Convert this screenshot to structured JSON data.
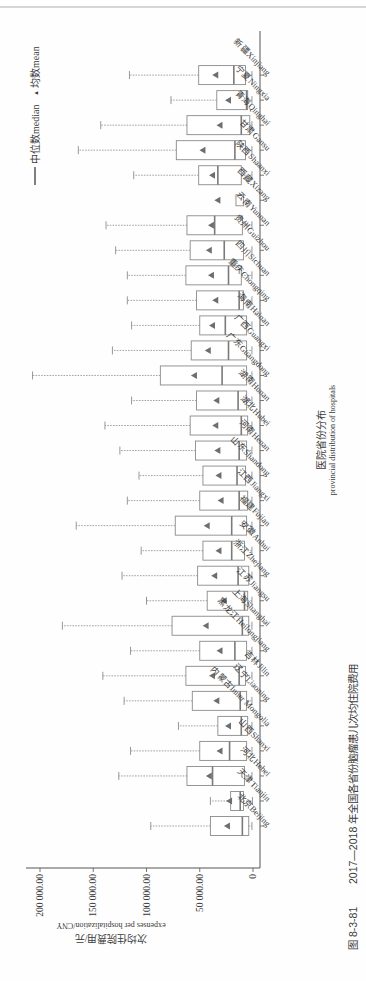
{
  "page": {
    "header_rule": true,
    "caption": {
      "figure_number": "图 8-3-81",
      "text": "2017—2018 年全国各省份脑瘤患儿次均住院费用"
    }
  },
  "legend": {
    "median_label": "中位数median",
    "mean_label": "均数mean",
    "mean_marker": "▲"
  },
  "colors": {
    "box_stroke": "#8a8a8a",
    "median_line": "#7a7a7a",
    "mean_marker": "#6e6e6e",
    "whisker": "#8c8c8c",
    "axis": "#555555",
    "text": "#3a3a3a"
  },
  "chart_data": {
    "type": "box",
    "orientation": "page rotated 90° (categories along vertical page axis)",
    "title": "2017—2018 年全国各省份脑瘤患儿次均住院费用",
    "xlabel": "医院省份分布 provincial distribution of hospitals",
    "xlabel_cn": "医院省份分布",
    "xlabel_en": "provincial distribution of hospitals",
    "ylabel": "次均住院费用/元 expenses per hospitalization/CNY",
    "ylabel_cn": "次均住院费用/元",
    "ylabel_en": "expenses per hospitalization/CNY",
    "ylim": [
      0,
      200000
    ],
    "yticks": [
      0,
      50000,
      100000,
      150000,
      200000
    ],
    "ytick_labels": [
      "0",
      "50 000.00",
      "100 000.00",
      "150 000.00",
      "200 000.00"
    ],
    "legend": [
      "中位数median",
      "均数mean"
    ],
    "grid": false,
    "categories": [
      "北京Beijing",
      "天津Tianjin",
      "河北Hebei",
      "山西Shanxi",
      "内蒙古Inner Mongolia",
      "辽宁Liaoning",
      "吉林Jilin",
      "黑龙江Heilongjiang",
      "上海Shanghai",
      "江苏Jiangsu",
      "浙江Zhejiang",
      "安徽Anhui",
      "福建Fujian",
      "江西Jiangxi",
      "山东Shandong",
      "河南Henan",
      "湖北Hubei",
      "湖南Hunan",
      "广东Guangdong",
      "广西Guangxi",
      "海南Hainan",
      "重庆Chongqing",
      "四川Sichuan",
      "贵州Guizhou",
      "云南Yunnan",
      "西藏Xizang",
      "陕西Shaanxi",
      "甘肃Gansu",
      "青海Qinghai",
      "宁夏Ningxia",
      "新疆Xinjiang"
    ],
    "boxes": [
      {
        "min": 1000,
        "q1": 4000,
        "median": 10000,
        "q3": 40000,
        "max": 96000,
        "mean": 24000
      },
      {
        "min": 500,
        "q1": 9000,
        "median": 12000,
        "q3": 21000,
        "max": 40000,
        "mean": 22000
      },
      {
        "min": 1000,
        "q1": 8000,
        "median": 38000,
        "q3": 62000,
        "max": 126000,
        "mean": 41000
      },
      {
        "min": 1000,
        "q1": 6000,
        "median": 22000,
        "q3": 50000,
        "max": 115000,
        "mean": 31000
      },
      {
        "min": 1000,
        "q1": 5000,
        "median": 11000,
        "q3": 33000,
        "max": 70000,
        "mean": 23000
      },
      {
        "min": 1000,
        "q1": 6000,
        "median": 12000,
        "q3": 57000,
        "max": 121000,
        "mean": 34000
      },
      {
        "min": 1000,
        "q1": 7000,
        "median": 13000,
        "q3": 63000,
        "max": 141000,
        "mean": 38000
      },
      {
        "min": 1000,
        "q1": 6000,
        "median": 17000,
        "q3": 50000,
        "max": 115000,
        "mean": 31000
      },
      {
        "min": 1000,
        "q1": 4000,
        "median": 10000,
        "q3": 76000,
        "max": 179000,
        "mean": 44000
      },
      {
        "min": 1000,
        "q1": 5000,
        "median": 8000,
        "q3": 43000,
        "max": 100000,
        "mean": 27000
      },
      {
        "min": 1000,
        "q1": 4000,
        "median": 14000,
        "q3": 52000,
        "max": 123000,
        "mean": 36000
      },
      {
        "min": 1000,
        "q1": 8000,
        "median": 20000,
        "q3": 47000,
        "max": 105000,
        "mean": 32000
      },
      {
        "min": 1000,
        "q1": 6000,
        "median": 20000,
        "q3": 73000,
        "max": 166000,
        "mean": 43000
      },
      {
        "min": 1000,
        "q1": 5000,
        "median": 13000,
        "q3": 50000,
        "max": 118000,
        "mean": 30000
      },
      {
        "min": 1000,
        "q1": 7000,
        "median": 15000,
        "q3": 47000,
        "max": 107000,
        "mean": 32000
      },
      {
        "min": 1000,
        "q1": 6000,
        "median": 13000,
        "q3": 54000,
        "max": 125000,
        "mean": 33000
      },
      {
        "min": 1000,
        "q1": 5000,
        "median": 11000,
        "q3": 59000,
        "max": 139000,
        "mean": 35000
      },
      {
        "min": 1000,
        "q1": 6000,
        "median": 14000,
        "q3": 53000,
        "max": 114000,
        "mean": 34000
      },
      {
        "min": 1000,
        "q1": 6000,
        "median": 29000,
        "q3": 87000,
        "max": 207000,
        "mean": 55000
      },
      {
        "min": 1000,
        "q1": 6000,
        "median": 23000,
        "q3": 58000,
        "max": 132000,
        "mean": 42000
      },
      {
        "min": 1000,
        "q1": 6000,
        "median": 26000,
        "q3": 50000,
        "max": 114000,
        "mean": 38000
      },
      {
        "min": 1000,
        "q1": 9000,
        "median": 13000,
        "q3": 53000,
        "max": 118000,
        "mean": 35000
      },
      {
        "min": 1000,
        "q1": 11000,
        "median": 23000,
        "q3": 63000,
        "max": 118000,
        "mean": 39000
      },
      {
        "min": 1000,
        "q1": 9000,
        "median": 27000,
        "q3": 59000,
        "max": 129000,
        "mean": 41000
      },
      {
        "min": 1000,
        "q1": 10000,
        "median": 36000,
        "q3": 62000,
        "max": 138000,
        "mean": 39000
      },
      {
        "min": 9000,
        "q1": 9000,
        "median": 12000,
        "q3": 16000,
        "max": 16000,
        "mean": 33000,
        "no_whiskers": true
      },
      {
        "min": 1000,
        "q1": 11000,
        "median": 33000,
        "q3": 51000,
        "max": 112000,
        "mean": 38000
      },
      {
        "min": 1000,
        "q1": 7000,
        "median": 17000,
        "q3": 72000,
        "max": 164000,
        "mean": 47000
      },
      {
        "min": 1000,
        "q1": 3000,
        "median": 11000,
        "q3": 62000,
        "max": 143000,
        "mean": 31000
      },
      {
        "min": 1000,
        "q1": 5000,
        "median": 6000,
        "q3": 34000,
        "max": 77000,
        "mean": 23000
      },
      {
        "min": 1000,
        "q1": 7000,
        "median": 18000,
        "q3": 51000,
        "max": 116000,
        "mean": 35000
      }
    ]
  }
}
